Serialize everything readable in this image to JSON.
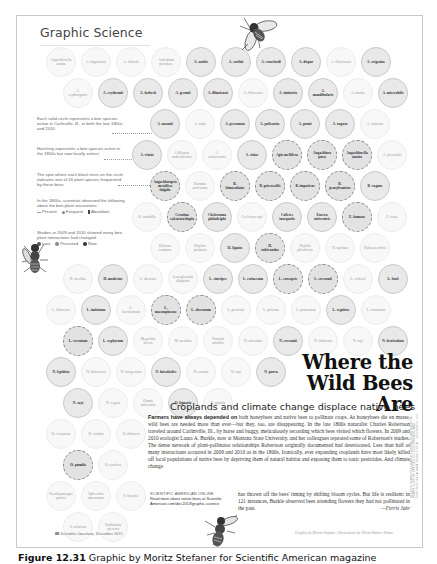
{
  "section_title": "Graphic Science",
  "legend": {
    "solid_circle": "Each solid circle represents a bee species active in Carlinville, Ill., in both the late 1800s and 2010",
    "hatched": "Hatching represents a bee species active in the 1800s but now locally extinct",
    "block": "The spot where each block rests on the circle indicates one of 26 plant species frequented by these bees",
    "observed_intro": "In the 1800s, scientists observed the following about the bee-plant encounters:",
    "observed_keys": [
      "Present",
      "Frequent",
      "Abundant"
    ],
    "changes_intro": "Studies in 2009 and 2010 showed many bee-plant interactions had changed:",
    "change_keys": [
      "Lost",
      "Persisted",
      "New"
    ]
  },
  "bubbles": [
    {
      "label": "Augochlorella aurata",
      "x": 46,
      "y": 47,
      "style": "faint"
    },
    {
      "label": "A. hippeustris",
      "x": 81,
      "y": 47,
      "style": "faint"
    },
    {
      "label": "A. ribicola",
      "x": 116,
      "y": 47,
      "style": "faint"
    },
    {
      "label": "Anthidium psoraleae",
      "x": 151,
      "y": 47,
      "style": "faint"
    },
    {
      "label": "A. arabis",
      "x": 186,
      "y": 47,
      "style": "solid"
    },
    {
      "label": "A. carlini",
      "x": 221,
      "y": 47,
      "style": "solid"
    },
    {
      "label": "A. crawfordi",
      "x": 256,
      "y": 47,
      "style": "solid"
    },
    {
      "label": "A. dispar",
      "x": 291,
      "y": 47,
      "style": "solid"
    },
    {
      "label": "A. illinoiensis",
      "x": 326,
      "y": 47,
      "style": "faint"
    },
    {
      "label": "A. erigeniae",
      "x": 361,
      "y": 47,
      "style": "solid"
    },
    {
      "label": "A. erythrogaster",
      "x": 63,
      "y": 78,
      "style": "faint"
    },
    {
      "label": "A. erythronii",
      "x": 98,
      "y": 78,
      "style": "solid"
    },
    {
      "label": "A. forbesii",
      "x": 133,
      "y": 78,
      "style": "solid"
    },
    {
      "label": "A. geranii",
      "x": 168,
      "y": 78,
      "style": "solid"
    },
    {
      "label": "A. illinoiensis",
      "x": 203,
      "y": 78,
      "style": "solid"
    },
    {
      "label": "A. illinoensis",
      "x": 238,
      "y": 78,
      "style": "faint"
    },
    {
      "label": "A. imitatrix",
      "x": 273,
      "y": 78,
      "style": "solid"
    },
    {
      "label": "A. mandibularis",
      "x": 308,
      "y": 78,
      "style": "solid"
    },
    {
      "label": "A. mariae",
      "x": 343,
      "y": 78,
      "style": "faint"
    },
    {
      "label": "A. miserabilis",
      "x": 378,
      "y": 78,
      "style": "solid"
    },
    {
      "label": "A. nasonii",
      "x": 150,
      "y": 109,
      "style": "solid"
    },
    {
      "label": "A. nuda",
      "x": 185,
      "y": 109,
      "style": "faint"
    },
    {
      "label": "A. personata",
      "x": 220,
      "y": 109,
      "style": "solid"
    },
    {
      "label": "A. pulicariae",
      "x": 255,
      "y": 109,
      "style": "solid"
    },
    {
      "label": "A. pruni",
      "x": 290,
      "y": 109,
      "style": "solid"
    },
    {
      "label": "A. rugosa",
      "x": 325,
      "y": 109,
      "style": "solid"
    },
    {
      "label": "A. salicaria",
      "x": 360,
      "y": 109,
      "style": "faint"
    },
    {
      "label": "A. viator",
      "x": 132,
      "y": 140,
      "style": "solid"
    },
    {
      "label": "Calliopsis andreniformis",
      "x": 167,
      "y": 140,
      "style": "faint"
    },
    {
      "label": "A. ziziaeformis",
      "x": 202,
      "y": 140,
      "style": "faint"
    },
    {
      "label": "A. ziziae",
      "x": 237,
      "y": 140,
      "style": "solid"
    },
    {
      "label": "Apis mellifera",
      "x": 272,
      "y": 140,
      "style": "dense"
    },
    {
      "label": "Augochlora pura",
      "x": 307,
      "y": 140,
      "style": "dense"
    },
    {
      "label": "Augochlorella aurata",
      "x": 342,
      "y": 140,
      "style": "dense"
    },
    {
      "label": "A. pectoralis",
      "x": 377,
      "y": 140,
      "style": "faint"
    },
    {
      "label": "Augochloropsis metallica fulgida",
      "x": 150,
      "y": 171,
      "style": "dense"
    },
    {
      "label": "Bombus auricomus",
      "x": 185,
      "y": 171,
      "style": "faint"
    },
    {
      "label": "B. bimaculatus",
      "x": 220,
      "y": 171,
      "style": "dense"
    },
    {
      "label": "B. griseocollis",
      "x": 255,
      "y": 171,
      "style": "dense"
    },
    {
      "label": "B. impatiens",
      "x": 290,
      "y": 171,
      "style": "dense"
    },
    {
      "label": "B. pensylvanicus",
      "x": 325,
      "y": 171,
      "style": "dense"
    },
    {
      "label": "B. vagans",
      "x": 360,
      "y": 171,
      "style": "solid"
    },
    {
      "label": "B. variabilis",
      "x": 132,
      "y": 202,
      "style": "faint"
    },
    {
      "label": "Ceratina calcarata/dupla",
      "x": 167,
      "y": 202,
      "style": "dense"
    },
    {
      "label": "Chelostoma philadelphi",
      "x": 202,
      "y": 202,
      "style": "solid"
    },
    {
      "label": "Coelioxys sayi",
      "x": 237,
      "y": 202,
      "style": "faint"
    },
    {
      "label": "Colletes inaequalis",
      "x": 272,
      "y": 202,
      "style": "solid"
    },
    {
      "label": "Eucera atriventris",
      "x": 307,
      "y": 202,
      "style": "solid"
    },
    {
      "label": "E. hamata",
      "x": 342,
      "y": 202,
      "style": "dense"
    },
    {
      "label": "E. rosae",
      "x": 377,
      "y": 202,
      "style": "faint"
    },
    {
      "label": "Halictus confusus",
      "x": 150,
      "y": 233,
      "style": "faint"
    },
    {
      "label": "Hoplitis producta",
      "x": 185,
      "y": 233,
      "style": "faint"
    },
    {
      "label": "H. ligatus",
      "x": 220,
      "y": 233,
      "style": "solid"
    },
    {
      "label": "H. rubicundus",
      "x": 255,
      "y": 233,
      "style": "dense"
    },
    {
      "label": "Hoplitis pilosifrons",
      "x": 290,
      "y": 233,
      "style": "faint"
    },
    {
      "label": "H. spoliata",
      "x": 325,
      "y": 233,
      "style": "faint"
    },
    {
      "label": "Hylaeus affinis",
      "x": 360,
      "y": 233,
      "style": "faint"
    },
    {
      "label": "H. mesillae",
      "x": 63,
      "y": 264,
      "style": "faint"
    },
    {
      "label": "H. modestus",
      "x": 98,
      "y": 264,
      "style": "solid"
    },
    {
      "label": "L. aberrans",
      "x": 133,
      "y": 264,
      "style": "faint"
    },
    {
      "label": "Lasioglossum albipenne",
      "x": 168,
      "y": 264,
      "style": "faint"
    },
    {
      "label": "L. cinctipes",
      "x": 203,
      "y": 264,
      "style": "solid"
    },
    {
      "label": "L. coriaceum",
      "x": 238,
      "y": 264,
      "style": "solid"
    },
    {
      "label": "L. coreopsis",
      "x": 273,
      "y": 264,
      "style": "dense"
    },
    {
      "label": "L. cressonii",
      "x": 308,
      "y": 264,
      "style": "dense"
    },
    {
      "label": "L. forbesii",
      "x": 343,
      "y": 264,
      "style": "faint"
    },
    {
      "label": "L. foxii",
      "x": 378,
      "y": 264,
      "style": "solid"
    },
    {
      "label": "L. illinoense",
      "x": 46,
      "y": 295,
      "style": "faint"
    },
    {
      "label": "L. imitatum",
      "x": 81,
      "y": 295,
      "style": "solid"
    },
    {
      "label": "L. laevissimum",
      "x": 116,
      "y": 295,
      "style": "faint"
    },
    {
      "label": "L. macoupinense",
      "x": 151,
      "y": 295,
      "style": "dense"
    },
    {
      "label": "L. obscurum",
      "x": 186,
      "y": 295,
      "style": "dense"
    },
    {
      "label": "L. pectorale",
      "x": 221,
      "y": 295,
      "style": "faint"
    },
    {
      "label": "L. pilosum",
      "x": 256,
      "y": 295,
      "style": "faint"
    },
    {
      "label": "L. pruinosum",
      "x": 291,
      "y": 295,
      "style": "faint"
    },
    {
      "label": "L. regulare",
      "x": 326,
      "y": 295,
      "style": "solid"
    },
    {
      "label": "L. truncatum",
      "x": 361,
      "y": 295,
      "style": "faint"
    },
    {
      "label": "L. versatum",
      "x": 63,
      "y": 326,
      "style": "dense"
    },
    {
      "label": "L. zephyrum",
      "x": 98,
      "y": 326,
      "style": "solid"
    },
    {
      "label": "Megachile brevis",
      "x": 133,
      "y": 326,
      "style": "faint"
    },
    {
      "label": "M. mendica",
      "x": 168,
      "y": 326,
      "style": "faint"
    },
    {
      "label": "Nomada affabilis",
      "x": 203,
      "y": 326,
      "style": "faint"
    },
    {
      "label": "N. articulata",
      "x": 238,
      "y": 326,
      "style": "faint"
    },
    {
      "label": "N. cressonii",
      "x": 273,
      "y": 326,
      "style": "solid"
    },
    {
      "label": "N. imbricata",
      "x": 308,
      "y": 326,
      "style": "faint"
    },
    {
      "label": "N. sayi",
      "x": 343,
      "y": 326,
      "style": "faint"
    },
    {
      "label": "N. denticulata",
      "x": 378,
      "y": 326,
      "style": "solid"
    },
    {
      "label": "N. lepidota",
      "x": 46,
      "y": 357,
      "style": "solid"
    },
    {
      "label": "N. illinoensis",
      "x": 81,
      "y": 357,
      "style": "faint"
    },
    {
      "label": "N. integerrima",
      "x": 116,
      "y": 357,
      "style": "faint"
    },
    {
      "label": "N. luteoloides",
      "x": 151,
      "y": 357,
      "style": "solid"
    },
    {
      "label": "N. ovatula",
      "x": 186,
      "y": 357,
      "style": "faint"
    },
    {
      "label": "N. sayi",
      "x": 221,
      "y": 357,
      "style": "faint"
    },
    {
      "label": "N. parva",
      "x": 256,
      "y": 357,
      "style": "solid"
    },
    {
      "label": "N. sayi",
      "x": 63,
      "y": 388,
      "style": "solid"
    },
    {
      "label": "N. vegeta",
      "x": 98,
      "y": 388,
      "style": "faint"
    },
    {
      "label": "Osmia atriventris",
      "x": 133,
      "y": 388,
      "style": "faint"
    },
    {
      "label": "O. lignaria",
      "x": 168,
      "y": 388,
      "style": "solid"
    },
    {
      "label": "O. pumila",
      "x": 203,
      "y": 388,
      "style": "faint"
    },
    {
      "label": "O. conjuncta",
      "x": 46,
      "y": 419,
      "style": "faint"
    },
    {
      "label": "O. cordata",
      "x": 81,
      "y": 419,
      "style": "faint"
    },
    {
      "label": "O. distincta",
      "x": 116,
      "y": 419,
      "style": "faint"
    },
    {
      "label": "O. pumila",
      "x": 63,
      "y": 450,
      "style": "dense"
    },
    {
      "label": "O. conifera",
      "x": 98,
      "y": 450,
      "style": "faint"
    },
    {
      "label": "Pseudopanurgus parvus",
      "x": 46,
      "y": 481,
      "style": "faint"
    },
    {
      "label": "Sphecodes antennariae",
      "x": 81,
      "y": 481,
      "style": "faint"
    },
    {
      "label": "S. heraclei",
      "x": 116,
      "y": 481,
      "style": "faint"
    },
    {
      "label": "S. arthricus",
      "x": 63,
      "y": 512,
      "style": "faint"
    },
    {
      "label": "Synhalonia speciosa",
      "x": 98,
      "y": 512,
      "style": "faint"
    }
  ],
  "headline": {
    "line1": "Where the",
    "line2": "Wild Bees Are"
  },
  "subhead": "Croplands and climate change displace native bees",
  "article": {
    "lead": "Farmers have always depended on",
    "body": " both honeybees and native bees to pollinate crops. As honeybees die en masse, wild bees are needed more than ever—but they, too, are disappearing. In the late 1800s naturalist Charles Robertson traveled around Carlinville, Ill., by horse and buggy, meticulously recording which bees visited which flowers. In 2009 and 2010 ecologist Laura A. Burkle, now at Montana State University, and her colleagues repeated some of Robertson's studies. The dense network of plant-pollinator relationships Robertson originally documented had deteriorated. Less than half as many interactions occurred in 2009 and 2010 as in the 1800s. Ironically, ever expanding croplands have most likely killed off local populations of native bees by depriving them of natural habitat and exposing them to toxic pesticides. And climate change",
    "continuation": "has thrown off the bees' timing by shifting bloom cycles. But life is resilient: in 121 instances, Burkle observed bees attending flowers they had not pollinated in the past.",
    "byline": "—Ferris Jabr"
  },
  "online": {
    "label": "SCIENTIFIC AMERICAN ONLINE",
    "text": "Read more about native bees at Scientific",
    "url": "American.com/dec2013/graphic-science"
  },
  "folio": {
    "page": "88",
    "text": "Scientific American, December 2013"
  },
  "credits": "Graphic by Moritz Stefaner; Illustrations by Jillian Walters Ditner",
  "vertical_credit": "SOURCE: PLANT-POLLINATOR INTERACTIONS OVER 120 YEARS: LOSS OF SPECIES, CO-OCCURRENCE, AND FUNCTION, BY LAURA A. BURKLE ET AL., IN SCIENCE, VOL. 339, MARCH 29, 2013",
  "figure_caption": {
    "label": "Figure 12.31",
    "text": "Graphic by Moritz Stefaner for Scientific American magazine"
  }
}
